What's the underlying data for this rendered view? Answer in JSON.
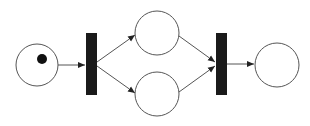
{
  "diagram": {
    "type": "petri-net",
    "colors": {
      "stroke": "#555555",
      "transition_fill": "#1a1a1a",
      "token": "#111111",
      "background": "#ffffff"
    },
    "places": [
      {
        "id": "p1",
        "cx": 37,
        "cy": 65,
        "r": 21,
        "tokens": 1
      },
      {
        "id": "p2",
        "cx": 157,
        "cy": 33,
        "r": 22,
        "tokens": 0
      },
      {
        "id": "p3",
        "cx": 157,
        "cy": 94,
        "r": 22,
        "tokens": 0
      },
      {
        "id": "p4",
        "cx": 277,
        "cy": 65,
        "r": 22,
        "tokens": 0
      }
    ],
    "transitions": [
      {
        "id": "t1",
        "x": 86,
        "y": 33,
        "w": 11,
        "h": 62
      },
      {
        "id": "t2",
        "x": 216,
        "y": 33,
        "w": 11,
        "h": 62
      }
    ],
    "arcs": [
      {
        "from": "p1",
        "to": "t1"
      },
      {
        "from": "t1",
        "to": "p2"
      },
      {
        "from": "t1",
        "to": "p3"
      },
      {
        "from": "p2",
        "to": "t2"
      },
      {
        "from": "p3",
        "to": "t2"
      },
      {
        "from": "t2",
        "to": "p4"
      }
    ]
  }
}
